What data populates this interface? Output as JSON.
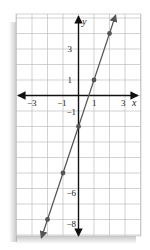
{
  "chart_data": {
    "type": "line",
    "title": "",
    "equation": "y = 3x - 2",
    "xlabel": "x",
    "ylabel": "y",
    "xlim": [
      -3.5,
      4.5
    ],
    "ylim": [
      -9,
      5.3
    ],
    "grid": true,
    "x_tick_labels": [
      "-3",
      "-1",
      "1",
      "3"
    ],
    "x_ticks": [
      -3,
      -1,
      1,
      3
    ],
    "y_tick_labels": [
      "3",
      "1",
      "-1",
      "-6",
      "-8"
    ],
    "y_ticks": [
      3,
      1,
      -1,
      -6,
      -8
    ],
    "series": [
      {
        "name": "line",
        "color": "#555555",
        "points": [
          {
            "x": 2,
            "y": 4
          },
          {
            "x": 1,
            "y": 1
          },
          {
            "x": 0,
            "y": -2
          },
          {
            "x": -1,
            "y": -5
          },
          {
            "x": -2,
            "y": -8
          }
        ]
      }
    ]
  },
  "colors": {
    "grid": "#bfbfbf",
    "axis": "#111111",
    "line": "#555555",
    "point": "#555555"
  },
  "labels": {
    "x_axis": "x",
    "y_axis": "y",
    "tick_x_neg3": "−3",
    "tick_x_neg1": "−1",
    "tick_x_1": "1",
    "tick_x_3": "3",
    "tick_y_3": "3",
    "tick_y_1": "1",
    "tick_y_neg1": "−1",
    "tick_y_neg6": "−6",
    "tick_y_neg8": "−8"
  }
}
